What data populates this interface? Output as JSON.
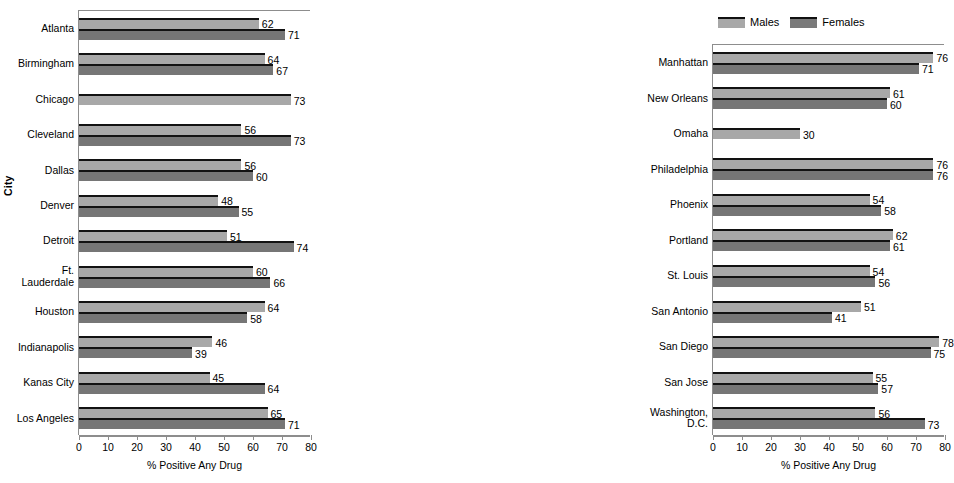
{
  "figure": {
    "y_axis_caption": "City",
    "legend": {
      "position": "top-center-right-panel",
      "entries": [
        {
          "label": "Males",
          "color": "#a8a8a8",
          "key": "males"
        },
        {
          "label": "Females",
          "color": "#767676",
          "key": "females"
        }
      ]
    }
  },
  "chart_data": [
    {
      "id": "left",
      "type": "bar",
      "orientation": "horizontal",
      "title": "",
      "xlabel": "% Positive Any Drug",
      "ylabel": "City",
      "xlim": [
        0,
        80
      ],
      "xticks": [
        0,
        10,
        20,
        30,
        40,
        50,
        60,
        70,
        80
      ],
      "grid": false,
      "legend": [
        "Males",
        "Females"
      ],
      "categories": [
        "Atlanta",
        "Birmingham",
        "Chicago",
        "Cleveland",
        "Dallas",
        "Denver",
        "Detroit",
        "Ft.\nLauderdale",
        "Houston",
        "Indianapolis",
        "Kanas City",
        "Los Angeles"
      ],
      "series": [
        {
          "name": "Males",
          "values": [
            62,
            64,
            73,
            56,
            56,
            48,
            51,
            60,
            64,
            46,
            45,
            65
          ]
        },
        {
          "name": "Females",
          "values": [
            71,
            67,
            null,
            73,
            60,
            55,
            74,
            66,
            58,
            39,
            64,
            71
          ]
        }
      ]
    },
    {
      "id": "right",
      "type": "bar",
      "orientation": "horizontal",
      "title": "",
      "xlabel": "% Positive Any Drug",
      "ylabel": "City",
      "xlim": [
        0,
        80
      ],
      "xticks": [
        0,
        10,
        20,
        30,
        40,
        50,
        60,
        70,
        80
      ],
      "grid": false,
      "legend": [
        "Males",
        "Females"
      ],
      "categories": [
        "Manhattan",
        "New Orleans",
        "Omaha",
        "Philadelphia",
        "Phoenix",
        "Portland",
        "St. Louis",
        "San Antonio",
        "San Diego",
        "San Jose",
        "Washington,\nD.C."
      ],
      "series": [
        {
          "name": "Males",
          "values": [
            76,
            61,
            30,
            76,
            54,
            62,
            54,
            51,
            78,
            55,
            56
          ]
        },
        {
          "name": "Females",
          "values": [
            71,
            60,
            null,
            76,
            58,
            61,
            56,
            41,
            75,
            57,
            73
          ]
        }
      ]
    }
  ]
}
